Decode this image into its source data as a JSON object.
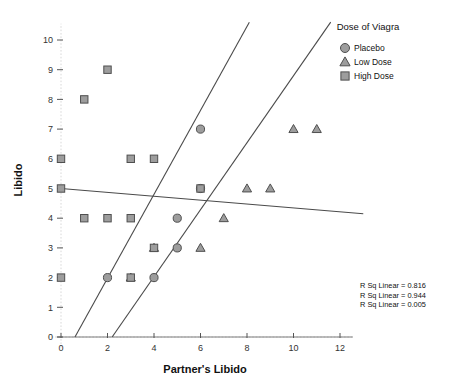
{
  "chart_data": {
    "type": "scatter",
    "title": "",
    "xlabel": "Partner's Libido",
    "ylabel": "Libido",
    "xlim": [
      -0.6,
      13.0
    ],
    "ylim": [
      0,
      10.6
    ],
    "xticks": [
      0,
      2,
      4,
      6,
      8,
      10,
      12
    ],
    "yticks": [
      0,
      1,
      2,
      3,
      4,
      5,
      6,
      7,
      8,
      9,
      10
    ],
    "grid": true,
    "legend": {
      "title": "Dose of Viagra",
      "position": "top-right",
      "entries": [
        {
          "label": "Placebo",
          "marker": "circle"
        },
        {
          "label": "Low Dose",
          "marker": "triangle"
        },
        {
          "label": "High Dose",
          "marker": "square"
        }
      ]
    },
    "series": [
      {
        "name": "Placebo",
        "marker": "circle",
        "points": [
          [
            2,
            2
          ],
          [
            4,
            2
          ],
          [
            5,
            3
          ],
          [
            5,
            4
          ],
          [
            6,
            5
          ],
          [
            6,
            7
          ]
        ],
        "fit": {
          "x0": 0.6,
          "y0": 0.0,
          "x1": 8.1,
          "y1": 10.6
        }
      },
      {
        "name": "Low Dose",
        "marker": "triangle",
        "points": [
          [
            3,
            2
          ],
          [
            4,
            3
          ],
          [
            6,
            3
          ],
          [
            7,
            4
          ],
          [
            8,
            5
          ],
          [
            9,
            5
          ],
          [
            10,
            7
          ],
          [
            11,
            7
          ]
        ],
        "fit": {
          "x0": 2.2,
          "y0": 0.0,
          "x1": 11.6,
          "y1": 10.6
        }
      },
      {
        "name": "High Dose",
        "marker": "square",
        "points": [
          [
            0,
            2
          ],
          [
            3,
            2
          ],
          [
            1,
            4
          ],
          [
            2,
            4
          ],
          [
            3,
            4
          ],
          [
            4,
            3
          ],
          [
            6,
            5
          ],
          [
            0,
            5
          ],
          [
            0,
            6
          ],
          [
            3,
            6
          ],
          [
            4,
            6
          ],
          [
            1,
            8
          ],
          [
            2,
            9
          ]
        ],
        "fit": {
          "x0": 0.0,
          "y0": 5.0,
          "x1": 13.0,
          "y1": 4.15
        }
      }
    ],
    "annotations": [
      "R Sq Linear = 0.816",
      "R Sq Linear = 0.944",
      "R Sq Linear = 0.005"
    ]
  }
}
